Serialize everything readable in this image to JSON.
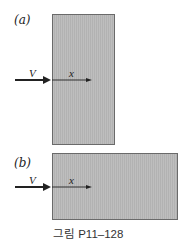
{
  "figure": {
    "caption": "그림 P11–128",
    "panels": [
      {
        "id": "a",
        "label": "(a)",
        "flow_symbol": "V",
        "axis_symbol": "x",
        "plate_orientation": "tall"
      },
      {
        "id": "b",
        "label": "(b)",
        "flow_symbol": "V",
        "axis_symbol": "x",
        "plate_orientation": "wide"
      }
    ],
    "colors": {
      "plate_fill": "#b9b9b9",
      "plate_border": "#6a6a6a",
      "arrow": "#222222",
      "text": "#222222"
    }
  }
}
